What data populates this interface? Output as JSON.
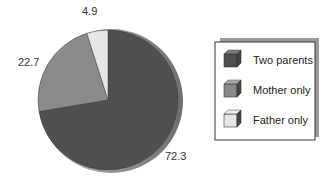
{
  "chart_data": {
    "type": "pie",
    "title": "",
    "categories": [
      "Two parents",
      "Mother only",
      "Father only"
    ],
    "values": [
      72.3,
      22.7,
      4.9
    ],
    "data_labels": [
      "72.3",
      "22.7",
      "4.9"
    ],
    "colors": [
      "#4f4f4f",
      "#8a8a8a",
      "#e6e6e6"
    ],
    "legend_position": "right",
    "style": "3d-shaded"
  },
  "legend": {
    "items": [
      {
        "label": "Two parents",
        "color": "#4f4f4f"
      },
      {
        "label": "Mother only",
        "color": "#8a8a8a"
      },
      {
        "label": "Father only",
        "color": "#e6e6e6"
      }
    ]
  },
  "labels": {
    "two_parents": "72.3",
    "mother_only": "22.7",
    "father_only": "4.9"
  }
}
